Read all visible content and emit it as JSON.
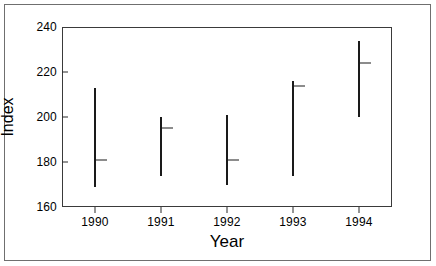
{
  "chart_data": {
    "type": "bar",
    "subtype": "range-with-median",
    "title": "",
    "xlabel": "Year",
    "ylabel": "Index",
    "categories": [
      "1990",
      "1991",
      "1992",
      "1993",
      "1994"
    ],
    "x": [
      1990,
      1991,
      1992,
      1993,
      1994
    ],
    "xlim": [
      1989.5,
      1994.5
    ],
    "ylim": [
      160,
      240
    ],
    "y_ticks": [
      160,
      180,
      200,
      220,
      240
    ],
    "y_tick_labels": [
      "160",
      "180",
      "200",
      "220",
      "240"
    ],
    "x_ticks": [
      1990,
      1991,
      1992,
      1993,
      1994
    ],
    "x_tick_labels": [
      "1990",
      "1991",
      "1992",
      "1993",
      "1994"
    ],
    "grid": false,
    "legend": null,
    "series": [
      {
        "name": "high",
        "values": [
          213,
          200,
          201,
          216,
          234
        ]
      },
      {
        "name": "low",
        "values": [
          169,
          174,
          170,
          174,
          200
        ]
      },
      {
        "name": "median",
        "values": [
          181,
          195,
          181,
          214,
          224
        ]
      }
    ],
    "points": [
      {
        "category": "1990",
        "low": 169,
        "median": 181,
        "high": 213
      },
      {
        "category": "1991",
        "low": 174,
        "median": 195,
        "high": 200
      },
      {
        "category": "1992",
        "low": 170,
        "median": 181,
        "high": 201
      },
      {
        "category": "1993",
        "low": 174,
        "median": 214,
        "high": 216
      },
      {
        "category": "1994",
        "low": 200,
        "median": 224,
        "high": 234
      }
    ],
    "colors": {
      "bar": "#1a1a1a",
      "axis": "#3a3a3a",
      "frame": "#6f6f6f",
      "text": "#000000",
      "background": "#ffffff"
    }
  },
  "figure": {
    "y_axis_title": "Index",
    "x_axis_title": "Year"
  }
}
